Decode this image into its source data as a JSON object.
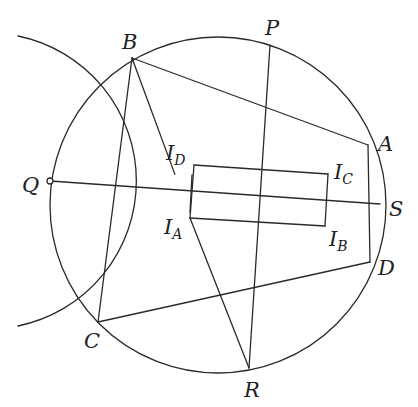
{
  "diagram": {
    "stroke_color": "#2a2a2a",
    "circles": [
      {
        "name": "circumcircle",
        "cx": 218,
        "cy": 205,
        "r": 168
      },
      {
        "name": "left-circle",
        "cx": 46,
        "cy": 181,
        "r": 148,
        "arc_from": [
          18,
          36
        ],
        "arc_to": [
          18,
          326
        ]
      }
    ],
    "points": {
      "B": [
        132,
        58
      ],
      "P": [
        270,
        45
      ],
      "A": [
        368,
        145
      ],
      "S": [
        380,
        204
      ],
      "D": [
        370,
        262
      ],
      "R": [
        249,
        368
      ],
      "C": [
        98,
        322
      ],
      "Q": [
        50,
        181
      ],
      "ID": [
        194,
        165
      ],
      "IC": [
        328,
        174
      ],
      "IB": [
        325,
        226
      ],
      "IA": [
        190,
        218
      ]
    },
    "segments": [
      [
        "B",
        "A"
      ],
      [
        "B",
        "C"
      ],
      [
        "C",
        "D"
      ],
      [
        "A",
        "D"
      ],
      [
        "P",
        "R"
      ],
      [
        "Q",
        "S"
      ],
      [
        "IA",
        "R"
      ],
      [
        "ID",
        "IC"
      ],
      [
        "IC",
        "IB"
      ],
      [
        "IB",
        "IA"
      ],
      [
        "IA",
        "ID"
      ]
    ],
    "labels": [
      {
        "id": "B",
        "text": "B",
        "x": 122,
        "y": 49
      },
      {
        "id": "P",
        "text": "P",
        "x": 265,
        "y": 35
      },
      {
        "id": "A",
        "text": "A",
        "x": 378,
        "y": 151
      },
      {
        "id": "S",
        "text": "S",
        "x": 389,
        "y": 216
      },
      {
        "id": "D",
        "text": "D",
        "x": 378,
        "y": 275
      },
      {
        "id": "R",
        "text": "R",
        "x": 244,
        "y": 397
      },
      {
        "id": "C",
        "text": "C",
        "x": 84,
        "y": 348
      },
      {
        "id": "Q",
        "text": "Q",
        "x": 22,
        "y": 192
      },
      {
        "id": "ID",
        "text": "I",
        "sub": "D",
        "x": 166,
        "y": 160
      },
      {
        "id": "IC",
        "text": "I",
        "sub": "C",
        "x": 334,
        "y": 179
      },
      {
        "id": "IB",
        "text": "I",
        "sub": "B",
        "x": 329,
        "y": 246
      },
      {
        "id": "IA",
        "text": "I",
        "sub": "A",
        "x": 164,
        "y": 234
      }
    ],
    "q_marker": {
      "cx": 50,
      "cy": 181,
      "r": 3
    }
  }
}
